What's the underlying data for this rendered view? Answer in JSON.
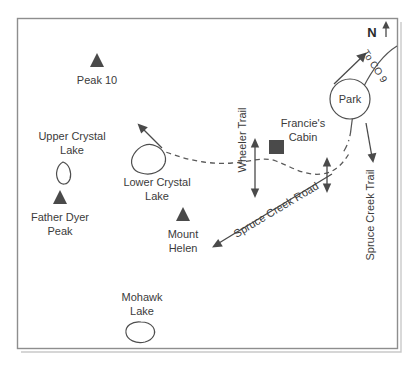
{
  "map": {
    "title": "Crystal Lakes / Spruce Creek area trail map",
    "frame": {
      "x": 17,
      "y": 18,
      "width": 380,
      "height": 330
    },
    "compass": {
      "label": "N",
      "arrow_glyph": "arrow-up"
    },
    "peaks": [
      {
        "name": "Peak 10",
        "label_lines": [
          "Peak 10"
        ],
        "marker_x": 97,
        "marker_y": 62,
        "label_x": 97,
        "label_y": 84
      },
      {
        "name": "Father Dyer Peak",
        "label_lines": [
          "Father Dyer",
          "Peak"
        ],
        "marker_x": 60,
        "marker_y": 199,
        "label_x": 60,
        "label_y": 221
      },
      {
        "name": "Mount Helen",
        "label_lines": [
          "Mount",
          "Helen"
        ],
        "marker_x": 183,
        "marker_y": 216,
        "label_x": 183,
        "label_y": 238
      }
    ],
    "lakes": [
      {
        "name": "Upper Crystal Lake",
        "label_lines": [
          "Upper Crystal",
          "Lake"
        ],
        "label_x": 72,
        "label_y": 140
      },
      {
        "name": "Lower Crystal Lake",
        "label_lines": [
          "Lower Crystal",
          "Lake"
        ],
        "label_x": 157,
        "label_y": 186
      },
      {
        "name": "Mohawk Lake",
        "label_lines": [
          "Mohawk",
          "Lake"
        ],
        "label_x": 142,
        "label_y": 301
      }
    ],
    "places": [
      {
        "name": "Francie's Cabin",
        "label_lines": [
          "Francie's",
          "Cabin"
        ],
        "label_x": 303,
        "label_y": 127,
        "marker_x": 276,
        "marker_y": 147
      },
      {
        "name": "Park",
        "label_lines": [
          "Park"
        ],
        "label_x": 350,
        "label_y": 103
      }
    ],
    "routes": [
      {
        "name": "Wheeler Trail",
        "label": "Wheeler Trail",
        "orientation": "vertical",
        "label_x": 246,
        "label_y": 140
      },
      {
        "name": "Spruce Creek Road",
        "label": "Spruce Creek Road",
        "orientation": "diagonal",
        "label_x": 277,
        "label_y": 216
      },
      {
        "name": "Spruce Creek Trail",
        "label": "Spruce Creek Trail",
        "orientation": "vertical",
        "label_x": 374,
        "label_y": 215
      },
      {
        "name": "To CO 9",
        "label": "To CO 9",
        "orientation": "diagonal",
        "label_x": 372,
        "label_y": 68
      }
    ]
  }
}
